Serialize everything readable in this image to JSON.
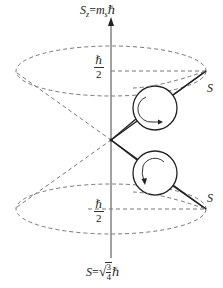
{
  "diagram": {
    "axis": {
      "top_label": "S₂=mₛℏ",
      "top_label_parts": {
        "S": "S",
        "sub_z": "z",
        "eq": "=",
        "m": "m",
        "sub_s": "s",
        "hbar": "ℏ"
      },
      "bottom_label_parts": {
        "S": "S",
        "eq": "=",
        "radical": "√",
        "num": "3",
        "den": "4",
        "hbar": "ℏ"
      }
    },
    "projections": {
      "upper": {
        "num": "ℏ",
        "den": "2"
      },
      "lower": {
        "num": "ℏ",
        "den": "2"
      }
    },
    "vectors": {
      "upper": {
        "label": "S"
      },
      "lower": {
        "label": "S"
      }
    },
    "colors": {
      "line": "#222222",
      "dashed": "#777777",
      "axis": "#444444"
    }
  }
}
